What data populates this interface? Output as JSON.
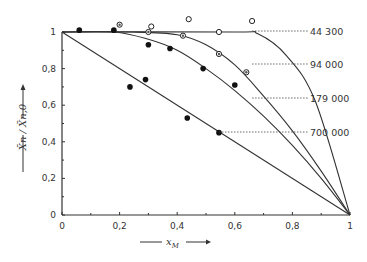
{
  "chart_data": {
    "type": "line",
    "title": "",
    "xlabel": "x_M",
    "ylabel": "X̄n / X̄n,0",
    "xlim": [
      0,
      1
    ],
    "ylim": [
      0,
      1
    ],
    "grid": false,
    "legend_position": "right, inline labels with dotted leaders",
    "x_ticks": [
      "0",
      "0,2",
      "0,4",
      "0,6",
      "0,8",
      "1"
    ],
    "y_ticks": [
      "0",
      "0,2",
      "0,4",
      "0,6",
      "0,8",
      "1"
    ],
    "series": [
      {
        "name": "44 300",
        "marker": "open-circle",
        "curve": [
          [
            0,
            1
          ],
          [
            0.6,
            1
          ],
          [
            0.68,
            0.99
          ],
          [
            0.78,
            0.87
          ],
          [
            0.88,
            0.62
          ],
          [
            1,
            0
          ]
        ],
        "points": [
          [
            0.31,
            1.03
          ],
          [
            0.44,
            1.07
          ],
          [
            0.545,
            1.0
          ],
          [
            0.66,
            1.06
          ]
        ]
      },
      {
        "name": "94 000",
        "marker": "half-filled-circle",
        "curve": [
          [
            0,
            1
          ],
          [
            0.25,
            1
          ],
          [
            0.4,
            0.985
          ],
          [
            0.5,
            0.93
          ],
          [
            0.6,
            0.82
          ],
          [
            0.7,
            0.65
          ],
          [
            0.8,
            0.46
          ],
          [
            0.9,
            0.24
          ],
          [
            1,
            0
          ]
        ],
        "points": [
          [
            0.2,
            1.04
          ],
          [
            0.3,
            1.0
          ],
          [
            0.42,
            0.98
          ],
          [
            0.545,
            0.88
          ],
          [
            0.64,
            0.78
          ]
        ]
      },
      {
        "name": "179 000",
        "marker": "filled-circle",
        "curve": [
          [
            0,
            1
          ],
          [
            0.18,
            1
          ],
          [
            0.3,
            0.96
          ],
          [
            0.4,
            0.9
          ],
          [
            0.5,
            0.8
          ],
          [
            0.6,
            0.68
          ],
          [
            0.7,
            0.54
          ],
          [
            0.8,
            0.38
          ],
          [
            0.9,
            0.2
          ],
          [
            1,
            0
          ]
        ],
        "points": [
          [
            0.06,
            1.01
          ],
          [
            0.18,
            1.01
          ],
          [
            0.3,
            0.93
          ],
          [
            0.375,
            0.91
          ],
          [
            0.49,
            0.8
          ],
          [
            0.6,
            0.71
          ]
        ]
      },
      {
        "name": "700 000",
        "marker": "filled-circle",
        "curve": [
          [
            0,
            1
          ],
          [
            1,
            0
          ]
        ],
        "points": [
          [
            0.236,
            0.7
          ],
          [
            0.29,
            0.74
          ],
          [
            0.435,
            0.53
          ],
          [
            0.545,
            0.45
          ]
        ]
      }
    ]
  },
  "labels": {
    "x_axis_title": "x",
    "x_axis_sub": "M",
    "y_axis_title": "X̄n / X̄n,0"
  }
}
